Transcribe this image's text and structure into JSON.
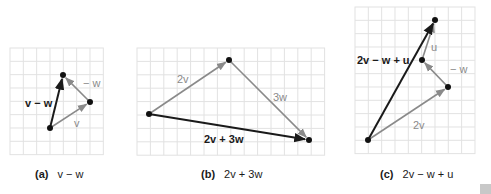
{
  "colors": {
    "grid": "#e2e2e2",
    "resultant": "#1a1a1a",
    "component": "#8a8a8a",
    "dot": "#111111",
    "corner_badge": "#c8c8c8"
  },
  "panels": [
    {
      "id": "a",
      "caption_label": "(a)",
      "caption_expr": "v − w",
      "grid": {
        "x0": 10,
        "y0": 48,
        "cols": 7,
        "rows": 8,
        "cell": 13.33
      },
      "points": {
        "start": [
          50,
          128
        ],
        "mid": [
          90,
          102
        ],
        "end": [
          63,
          75
        ]
      },
      "vectors": [
        {
          "name": "v",
          "from": "start",
          "to": "mid",
          "style": "component",
          "label": "v",
          "label_pos": [
            74,
            127
          ],
          "label_bold": false
        },
        {
          "name": "-w",
          "from": "mid",
          "to": "end",
          "style": "component",
          "label": "− w",
          "label_pos": [
            83,
            87
          ],
          "label_bold": false
        },
        {
          "name": "v-w",
          "from": "start",
          "to": "end",
          "style": "resultant",
          "label": "v − w",
          "label_pos": [
            25,
            107
          ],
          "label_bold": true
        }
      ]
    },
    {
      "id": "b",
      "caption_label": "(b)",
      "caption_expr": "2v + 3w",
      "grid": {
        "x0": 137,
        "y0": 48,
        "cols": 14,
        "rows": 8,
        "cell": 13.4
      },
      "points": {
        "start": [
          149,
          114
        ],
        "mid": [
          229,
          60
        ],
        "end": [
          309,
          140
        ]
      },
      "vectors": [
        {
          "name": "2v",
          "from": "start",
          "to": "mid",
          "style": "component",
          "label": "2v",
          "label_pos": [
            177,
            83
          ],
          "label_bold": false
        },
        {
          "name": "3w",
          "from": "mid",
          "to": "end",
          "style": "component",
          "label": "3w",
          "label_pos": [
            273,
            101
          ],
          "label_bold": false
        },
        {
          "name": "2v+3w",
          "from": "start",
          "to": "end",
          "style": "resultant",
          "label": "2v + 3w",
          "label_pos": [
            204,
            143
          ],
          "label_bold": false
        }
      ]
    },
    {
      "id": "c",
      "caption_label": "(c)",
      "caption_expr": "2v − w + u",
      "grid": {
        "x0": 355,
        "y0": 7,
        "cols": 9,
        "rows": 11,
        "cell": 13.33
      },
      "points": {
        "start": [
          368,
          140
        ],
        "p1": [
          448,
          87
        ],
        "p2": [
          422,
          60
        ],
        "end": [
          435,
          20
        ]
      },
      "vectors": [
        {
          "name": "2v",
          "from": "start",
          "to": "p1",
          "style": "component",
          "label": "2v",
          "label_pos": [
            413,
            129
          ],
          "label_bold": false
        },
        {
          "name": "-w",
          "from": "p1",
          "to": "p2",
          "style": "component",
          "label": "− w",
          "label_pos": [
            450,
            73
          ],
          "label_bold": false
        },
        {
          "name": "u",
          "from": "p2",
          "to": "end",
          "style": "component",
          "label": "u",
          "label_pos": [
            431,
            51
          ],
          "label_bold": false
        },
        {
          "name": "2v-w+u",
          "from": "start",
          "to": "end",
          "style": "resultant",
          "label": "2v − w + u",
          "label_pos": [
            357,
            64
          ],
          "label_bold": true
        }
      ]
    }
  ],
  "captions_pos": {
    "a": [
      35,
      178
    ],
    "b": [
      201,
      178
    ],
    "c": [
      380,
      178
    ]
  }
}
